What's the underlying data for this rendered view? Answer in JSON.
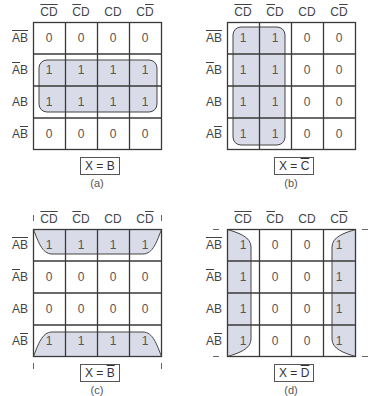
{
  "shading_color": "#d9dce8",
  "grid_color": "#3a3a3a",
  "columns": [
    {
      "parts": [
        {
          "t": "C",
          "bar": true
        },
        {
          "t": "D",
          "bar": true
        }
      ]
    },
    {
      "parts": [
        {
          "t": "C",
          "bar": true
        },
        {
          "t": "D",
          "bar": false
        }
      ]
    },
    {
      "parts": [
        {
          "t": "C",
          "bar": false
        },
        {
          "t": "D",
          "bar": false
        }
      ]
    },
    {
      "parts": [
        {
          "t": "C",
          "bar": false
        },
        {
          "t": "D",
          "bar": true
        }
      ]
    }
  ],
  "rows": [
    {
      "parts": [
        {
          "t": "A",
          "bar": true
        },
        {
          "t": "B",
          "bar": true
        }
      ]
    },
    {
      "parts": [
        {
          "t": "A",
          "bar": true
        },
        {
          "t": "B",
          "bar": false
        }
      ]
    },
    {
      "parts": [
        {
          "t": "A",
          "bar": false
        },
        {
          "t": "B",
          "bar": false
        }
      ]
    },
    {
      "parts": [
        {
          "t": "A",
          "bar": false
        },
        {
          "t": "B",
          "bar": true
        }
      ]
    }
  ],
  "maps": [
    {
      "id": "a",
      "caption": "(a)",
      "expression": {
        "lhs": "X = ",
        "var": "B",
        "bar": false
      },
      "values": [
        [
          "0",
          "0",
          "0",
          "0"
        ],
        [
          "1",
          "1",
          "1",
          "1"
        ],
        [
          "1",
          "1",
          "1",
          "1"
        ],
        [
          "0",
          "0",
          "0",
          "0"
        ]
      ],
      "grouping": "rows 2-3 (B)"
    },
    {
      "id": "b",
      "caption": "(b)",
      "expression": {
        "lhs": "X = ",
        "var": "C",
        "bar": true
      },
      "values": [
        [
          "1",
          "1",
          "0",
          "0"
        ],
        [
          "1",
          "1",
          "0",
          "0"
        ],
        [
          "1",
          "1",
          "0",
          "0"
        ],
        [
          "1",
          "1",
          "0",
          "0"
        ]
      ],
      "grouping": "columns 1-2 (C̄)"
    },
    {
      "id": "c",
      "caption": "(c)",
      "expression": {
        "lhs": "X = ",
        "var": "B",
        "bar": true
      },
      "values": [
        [
          "1",
          "1",
          "1",
          "1"
        ],
        [
          "0",
          "0",
          "0",
          "0"
        ],
        [
          "0",
          "0",
          "0",
          "0"
        ],
        [
          "1",
          "1",
          "1",
          "1"
        ]
      ],
      "grouping": "rows 1 and 4 wrap-around (B̄)"
    },
    {
      "id": "d",
      "caption": "(d)",
      "expression": {
        "lhs": "X = ",
        "var": "D",
        "bar": true
      },
      "values": [
        [
          "1",
          "0",
          "0",
          "1"
        ],
        [
          "1",
          "0",
          "0",
          "1"
        ],
        [
          "1",
          "0",
          "0",
          "1"
        ],
        [
          "1",
          "0",
          "0",
          "1"
        ]
      ],
      "grouping": "columns 1 and 4 wrap-around (D̄)"
    }
  ]
}
